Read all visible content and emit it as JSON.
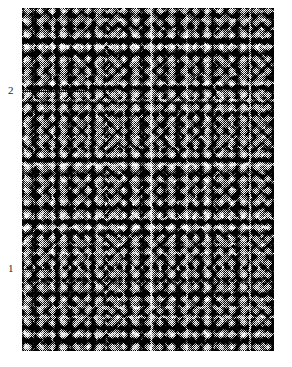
{
  "figure": {
    "type": "histology-micrograph",
    "staining_appearance": "black-and-white high-contrast halftone",
    "plate": {
      "x": 22,
      "y": 8,
      "width": 252,
      "height": 343,
      "background_color": "#ffffff",
      "description": "Dense cellular tissue section with numerous dark-staining nuclei and paler stromal strands"
    },
    "annotations": [
      {
        "id": "callout-2",
        "label": "2",
        "x": 8,
        "y": 85,
        "leader": {
          "x": 22,
          "y": 91,
          "length": 64
        }
      },
      {
        "id": "callout-1",
        "label": "1",
        "x": 8,
        "y": 263,
        "leader": {
          "x": 22,
          "y": 269,
          "length": 30
        }
      }
    ],
    "colors": {
      "ink": "#141414",
      "label_text": "#2a2a2a",
      "page": "#ffffff"
    }
  }
}
